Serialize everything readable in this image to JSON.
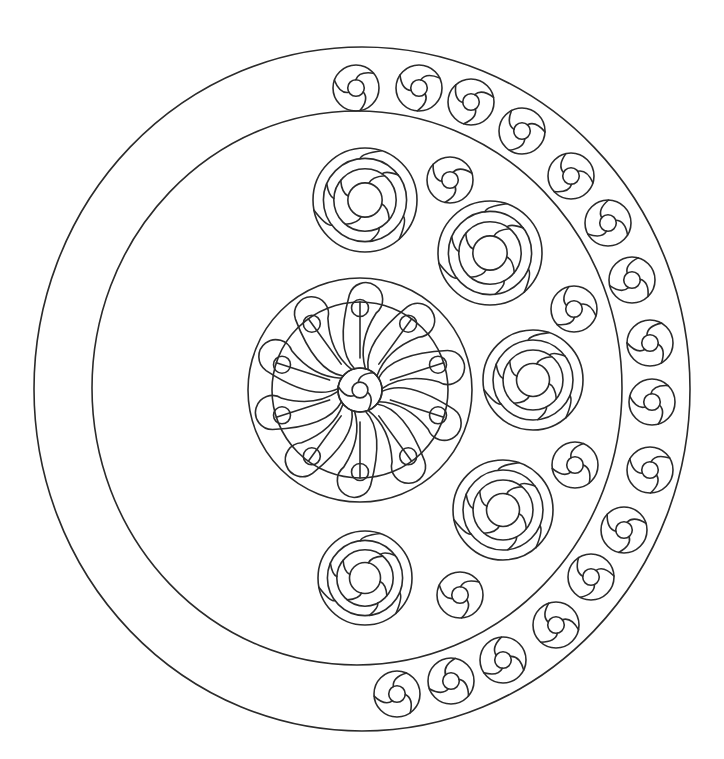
{
  "page": {
    "title": "Mandala coloring page"
  },
  "colors": {
    "stroke": "#2a2a2a",
    "background": "#ffffff"
  },
  "outer_ring": {
    "cx": 362,
    "cy": 389,
    "rx": 328,
    "ry": 342
  },
  "inner_ring": {
    "cx": 357,
    "cy": 388,
    "rx": 265,
    "ry": 277
  },
  "center_medallion": {
    "cx": 360,
    "cy": 390,
    "r": 112,
    "inner_r": 88,
    "hub_r": 22,
    "petals": 10
  },
  "large_rosettes": [
    {
      "cx": 365,
      "cy": 200,
      "r": 52
    },
    {
      "cx": 490,
      "cy": 253,
      "r": 52
    },
    {
      "cx": 533,
      "cy": 380,
      "r": 50
    },
    {
      "cx": 503,
      "cy": 510,
      "r": 50
    },
    {
      "cx": 365,
      "cy": 578,
      "r": 47
    }
  ],
  "small_rosettes_inner": [
    {
      "cx": 450,
      "cy": 180,
      "r": 23
    },
    {
      "cx": 574,
      "cy": 309,
      "r": 23
    },
    {
      "cx": 575,
      "cy": 465,
      "r": 23
    },
    {
      "cx": 460,
      "cy": 595,
      "r": 23
    }
  ],
  "band_rosettes": [
    {
      "cx": 356,
      "cy": 88,
      "r": 23
    },
    {
      "cx": 419,
      "cy": 88,
      "r": 23
    },
    {
      "cx": 471,
      "cy": 102,
      "r": 23
    },
    {
      "cx": 522,
      "cy": 131,
      "r": 23
    },
    {
      "cx": 571,
      "cy": 176,
      "r": 23
    },
    {
      "cx": 608,
      "cy": 223,
      "r": 23
    },
    {
      "cx": 632,
      "cy": 280,
      "r": 23
    },
    {
      "cx": 650,
      "cy": 343,
      "r": 23
    },
    {
      "cx": 652,
      "cy": 402,
      "r": 23
    },
    {
      "cx": 650,
      "cy": 470,
      "r": 23
    },
    {
      "cx": 624,
      "cy": 530,
      "r": 23
    },
    {
      "cx": 591,
      "cy": 577,
      "r": 23
    },
    {
      "cx": 556,
      "cy": 625,
      "r": 23
    },
    {
      "cx": 503,
      "cy": 660,
      "r": 23
    },
    {
      "cx": 451,
      "cy": 681,
      "r": 23
    },
    {
      "cx": 397,
      "cy": 694,
      "r": 23
    }
  ]
}
